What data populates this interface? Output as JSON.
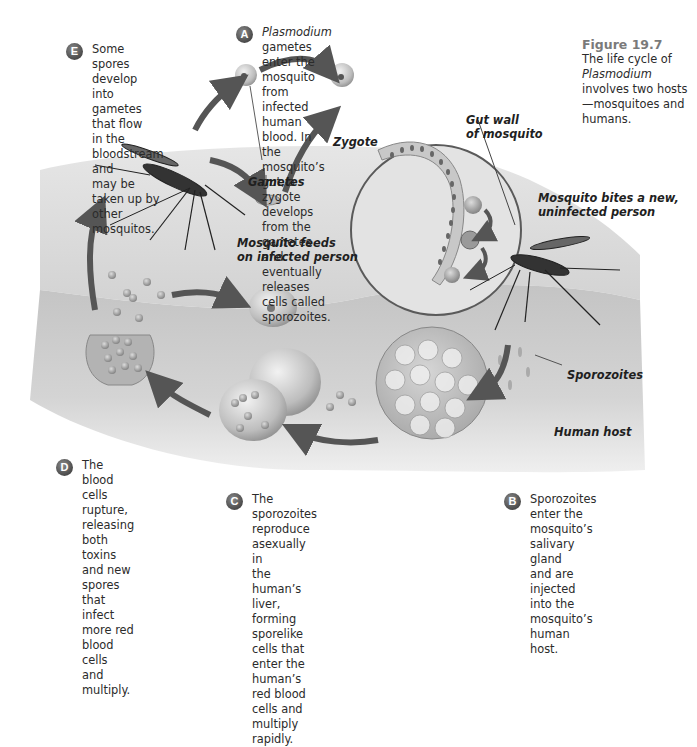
{
  "figure": {
    "number": "Figure 19.7",
    "caption_pre": "The life cycle of",
    "caption_italic": "Plasmodium",
    "caption_post": " involves two hosts—mosquitoes and humans."
  },
  "steps": {
    "A": {
      "badge": "A",
      "italic": "Plasmodium",
      "text": " gametes enter the mosquito\nfrom infected human blood. In the mosquito’s\ngut, a zygote develops from the gametes and\neventually releases cells called sporozoites."
    },
    "B": {
      "badge": "B",
      "text": "Sporozoites enter the\nmosquito’s salivary gland\nand are injected into the\nmosquito’s human host."
    },
    "C": {
      "badge": "C",
      "text": "The sporozoites reproduce asexually in\nthe human’s liver, forming sporelike\ncells that enter the human’s red blood\ncells and multiply rapidly."
    },
    "D": {
      "badge": "D",
      "text": "The blood cells\nrupture, releasing\nboth toxins and new\nspores that infect\nmore red blood cells\nand multiply."
    },
    "E": {
      "badge": "E",
      "text": "Some spores develop\ninto gametes that flow\nin the bloodstream and\nmay be taken up by\nother mosquitos."
    }
  },
  "labels": {
    "gametes": "Gametes",
    "zygote": "Zygote",
    "gut_wall": "Gut wall\nof mosquito",
    "mosquito_feeds": "Mosquito feeds\non infected person",
    "mosquito_bites": "Mosquito bites a new,\nuninfected person",
    "sporozoites": "Sporozoites",
    "human_host": "Human host"
  },
  "colors": {
    "badge": "#5a5a5a",
    "arrow": "#555555",
    "tissue_top": "#d9d9d9",
    "tissue_body": "#c9c9c9",
    "figure_title": "#7a7a7a"
  }
}
